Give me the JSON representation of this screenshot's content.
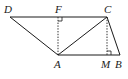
{
  "diagram": {
    "type": "geometry-figure",
    "points": {
      "D": {
        "label": "D",
        "x": 10,
        "y": 17
      },
      "F": {
        "label": "F",
        "x": 58,
        "y": 17
      },
      "C": {
        "label": "C",
        "x": 107,
        "y": 17
      },
      "A": {
        "label": "A",
        "x": 58,
        "y": 55
      },
      "M": {
        "label": "M",
        "x": 107,
        "y": 55
      },
      "B": {
        "label": "B",
        "x": 120,
        "y": 55
      }
    },
    "segments_solid": [
      "DC",
      "DA",
      "AC",
      "CB",
      "AB"
    ],
    "segments_dashed": [
      "FA",
      "CM"
    ],
    "right_angles": [
      "F",
      "M"
    ],
    "colors": {
      "stroke": "#1a1a1a",
      "background": "#ffffff"
    }
  }
}
